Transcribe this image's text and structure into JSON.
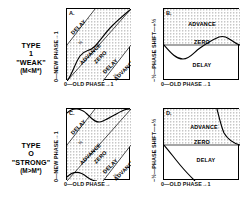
{
  "figure": {
    "rows": [
      {
        "id": "type-1-weak",
        "label_type": "TYPE",
        "label_number": "1",
        "label_word": "\"WEAK\"",
        "label_condition": "(M<M*)"
      },
      {
        "id": "type-0-strong",
        "label_type": "TYPE",
        "label_number": "O",
        "label_word": "\"STRONG\"",
        "label_condition": "(M>M*)"
      }
    ],
    "panels": [
      {
        "id": "A",
        "corner": "A.",
        "x_axis": {
          "label": "0—OLD PHASE→1",
          "min": "0",
          "max": "1"
        },
        "y_axis": {
          "label": "0—NEW PHASE→1",
          "min": "0",
          "max": "1"
        },
        "regions": [
          "DELAY",
          "ADVANCE",
          "ZERO",
          "DELAY",
          "ADVANCE"
        ],
        "band_labels": [
          "½",
          "½"
        ]
      },
      {
        "id": "B",
        "corner": "B.",
        "x_axis": {
          "label": "0—OLD PHASE→1",
          "min": "0",
          "max": "1"
        },
        "y_axis": {
          "label": "−½—PHASE SHIFT—+½",
          "min": "-½",
          "max": "+½"
        },
        "regions": [
          "ADVANCE",
          "ZERO",
          "DELAY"
        ],
        "band_labels": []
      },
      {
        "id": "C",
        "corner": "C.",
        "x_axis": {
          "label": "0—OLD PHASE→",
          "min": "0",
          "max": "1"
        },
        "y_axis": {
          "label": "0—NEW PHASE→1",
          "min": "0",
          "max": "1"
        },
        "regions": [
          "DELAY",
          "ADVANCE",
          "ZERO",
          "DELAY",
          "ADVANCE"
        ],
        "band_labels": [
          "½",
          "½"
        ]
      },
      {
        "id": "D",
        "corner": "D.",
        "x_axis": {
          "label": "0—OLD PHASE→1",
          "min": "0",
          "max": "1"
        },
        "y_axis": {
          "label": "−½—PHASE SHIFT—+½",
          "min": "-½",
          "max": "+½"
        },
        "regions": [
          "ADVANCE",
          "ZERO",
          "DELAY"
        ],
        "band_labels": []
      }
    ],
    "colors": {
      "ink": "#000000",
      "shade": "#c9c9c9",
      "background": "#ffffff"
    }
  }
}
